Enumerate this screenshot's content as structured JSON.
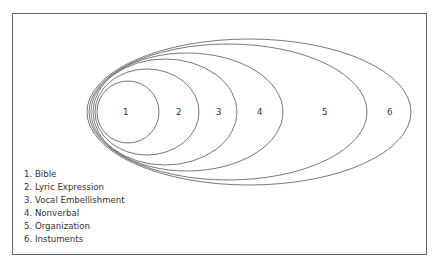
{
  "diagram": {
    "ellipses": [
      {
        "id": 1,
        "label": "1",
        "cx": 128,
        "cy": 112,
        "rx": 31,
        "ry": 31,
        "label_x": 123
      },
      {
        "id": 2,
        "label": "2",
        "cx": 147,
        "cy": 112,
        "rx": 52,
        "ry": 43,
        "label_x": 176
      },
      {
        "id": 3,
        "label": "3",
        "cx": 165,
        "cy": 112,
        "rx": 72,
        "ry": 53,
        "label_x": 216
      },
      {
        "id": 4,
        "label": "4",
        "cx": 187,
        "cy": 112,
        "rx": 96,
        "ry": 59,
        "label_x": 257
      },
      {
        "id": 5,
        "label": "5",
        "cx": 228,
        "cy": 112,
        "rx": 139,
        "ry": 68,
        "label_x": 322
      },
      {
        "id": 6,
        "label": "6",
        "cx": 249,
        "cy": 112,
        "rx": 162,
        "ry": 73,
        "label_x": 387
      }
    ],
    "legend": [
      "1. Bible",
      "2. Lyric Expression",
      "3. Vocal Embellishment",
      "4. Nonverbal",
      "5. Organization",
      "6. Instuments"
    ]
  }
}
